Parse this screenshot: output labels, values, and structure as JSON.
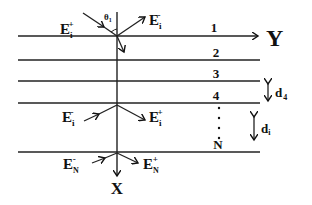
{
  "diagram": {
    "type": "multilayer-stack",
    "axes": {
      "horizontal": "Y",
      "vertical": "X"
    },
    "layers": [
      {
        "label": "1",
        "y": 36
      },
      {
        "label": "2",
        "y": 60
      },
      {
        "label": "3",
        "y": 81
      },
      {
        "label": "4",
        "y": 103
      },
      {
        "label": "N",
        "y": 152
      }
    ],
    "ellipsis": "⋮",
    "angle_label": "θ",
    "angle_sub": "1",
    "fields": {
      "top_incident": {
        "main": "E",
        "sub": "i",
        "sup": "+"
      },
      "top_reflected": {
        "main": "E",
        "sub": "i",
        "sup": "-"
      },
      "mid_left": {
        "main": "E",
        "sub": "i",
        "sup": "-"
      },
      "mid_right": {
        "main": "E",
        "sub": "i",
        "sup": "+"
      },
      "bottom_left": {
        "main": "E",
        "sub": "N",
        "sup": "-"
      },
      "bottom_right": {
        "main": "E",
        "sub": "N",
        "sup": "+"
      }
    },
    "thickness_labels": [
      {
        "main": "d",
        "sub": "4"
      },
      {
        "main": "d",
        "sub": "i"
      }
    ]
  }
}
